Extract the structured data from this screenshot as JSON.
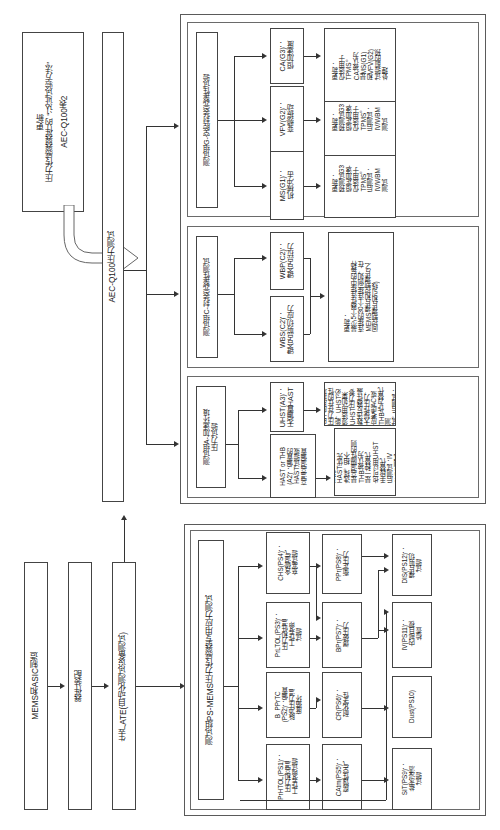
{
  "diagram": {
    "title": "AEC-Q100表2 压力传感器器件的 “认证试验方法” 更新",
    "orientation": "rotated-90-ccw",
    "source_title_line1": "AEC-Q100表2",
    "source_title_line2": "压力传感器器件的 “认证试验方法”",
    "source_title_line3": "更新",
    "spine_stress": "AEC-Q100压力测试",
    "spine_ate": "生产ATE(自动化测试设备测试)"
  },
  "process": {
    "manufacture": "MEMS和ASIC制造",
    "assembly": "器件装配",
    "ate": "生产ATE(自动化测试设备测试)"
  },
  "group_g": {
    "title": "测试组G-空腔封装完整性试验",
    "tests": [
      {
        "label": "MS(G1)：\n机械冲击",
        "update": "更新：\n预测试G3\n恒定加速-\n仅适用于\nTPMS。\n后测试：\nIV/WBM\n测试"
      },
      {
        "label": "VFV(G2)：\n变频振动",
        "update": "更新：\n预测试G3\n恒定加速-\n仅适用于\nTPMS。\n后测试：\nIV/WBM\n测试"
      },
      {
        "label": "CA(G3)：\n恒加速度",
        "update": "更新：\n仅适用于\nTPMS。\nCA被认为\n是MS(G1)\n和VFV(G2)\n试验前的预\n处理"
      }
    ]
  },
  "group_c": {
    "title": "测试组C-封装完整性测试",
    "tests": [
      {
        "label": "WBS(C2)：\n键合点剪切应力"
      },
      {
        "label": "WBP(C2)：\n键合点拉力"
      }
    ],
    "update": "更新：\n最少5个器件连接中的每种\n连接的30个连接(例如，在\nMEMS裸片和控制裸片之\n间控制裸片和引线)"
  },
  "group_a": {
    "title": "测试组A-加速环境\n压力试验",
    "tests": [
      {
        "label": "HAST or THB\n(A2)：偏置的\nHAST试验或\n高温高湿偏置",
        "update": "更新：\nHAST优先\n选择。相不\n是高湿隔性的则\nTHB被认为\n是一种替代\n也可以用UHST\n手段替代\n后测试：IV\n/WBP测试"
      },
      {
        "label": "UHST(A3)：\n无偏置HAST",
        "update": "更新：\n由于应用环境\n压力存在的性\n能，UHST必\n须适用(如果\nUHST压力参\n数违反器件最\n大操作压力，\n应考虑AC或\nTHB作为替代测\n试。后测试：\nIV/WBP测试"
      }
    ]
  },
  "group_ps": {
    "title": "测试组PS-MEMS压力传感器专用应力测试",
    "col1": [
      "PrHTOL(PS1)：\n压力和高温\n工作寿命试验",
      "B_PPrTC\n(PS2)：偏置\n脉冲压力温\n度循环",
      "PrLTOL(PS3)：\n压力和低温\n工作寿命\n试验",
      "CHS(PS4)：\n含硫湿气\n充塞试验"
    ],
    "col2": [
      "CAtm(PS5)：\n腐蚀性空气",
      "CR(PS6)：\n耐化学性",
      "BPr(PS7)：\n爆破压力",
      "PPr(PS8)：\n衡定压力"
    ],
    "col3": [
      "SIT(PS9)：\n盐水浸渍\n试验",
      "Dust(PS10)",
      "IV(PS11)：\n内部目视\n检查",
      "DIS(PS12)：\n裸片剪切\n试验"
    ]
  },
  "colors": {
    "line": "#333333",
    "border": "#444444",
    "frame": "#5a5a5a",
    "background": "#ffffff"
  }
}
